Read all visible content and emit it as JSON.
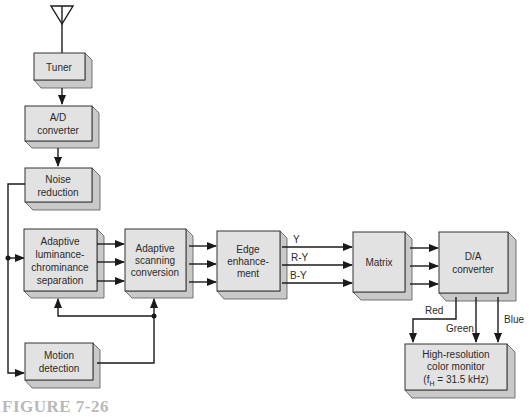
{
  "figure": {
    "caption": "FIGURE 7-26"
  },
  "blocks": {
    "tuner": {
      "lines": [
        "Tuner"
      ]
    },
    "ad_converter": {
      "lines": [
        "A/D",
        "converter"
      ]
    },
    "noise_reduction": {
      "lines": [
        "Noise",
        "reduction"
      ]
    },
    "lum_chrom_sep": {
      "lines": [
        "Adaptive",
        "luminance-",
        "chrominance",
        "separation"
      ]
    },
    "scanning_conversion": {
      "lines": [
        "Adaptive",
        "scanning",
        "conversion"
      ]
    },
    "edge_enhancement": {
      "lines": [
        "Edge",
        "enhance-",
        "ment"
      ]
    },
    "matrix": {
      "lines": [
        "Matrix"
      ]
    },
    "da_converter": {
      "lines": [
        "D/A",
        "converter"
      ]
    },
    "motion_detection": {
      "lines": [
        "Motion",
        "detection"
      ]
    },
    "monitor": {
      "lines": [
        "High-resolution",
        "color monitor",
        "(f",
        "H",
        " = 31.5 kHz)"
      ]
    }
  },
  "signals": {
    "y": "Y",
    "r_y": "R-Y",
    "b_y": "B-Y",
    "red": "Red",
    "green": "Green",
    "blue": "Blue"
  },
  "colors": {
    "box_face": "#e2e2e2",
    "box_side": "#c9c9c9",
    "line": "#1a1a1a",
    "caption": "#b9b9b9"
  }
}
